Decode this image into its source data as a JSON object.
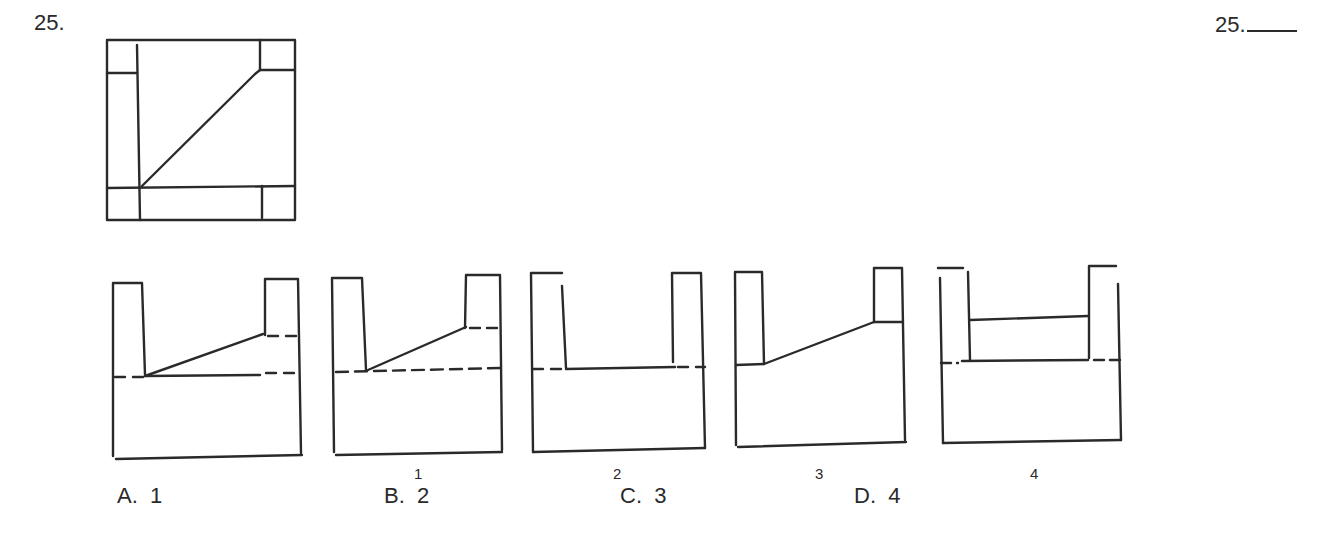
{
  "question": {
    "number_label": "25.",
    "answer_label": "25.",
    "answer_blank": ""
  },
  "top_view": {
    "description": "Top view: square with corner squares at top-left and top-right, left vertical band, bottom horizontal band, and a diagonal line from bottom-left inner corner to top-right inner corner"
  },
  "views": [
    {
      "id": "given",
      "caption": ""
    },
    {
      "id": "1",
      "caption": "1"
    },
    {
      "id": "2",
      "caption": "2"
    },
    {
      "id": "3",
      "caption": "3"
    },
    {
      "id": "4",
      "caption": "4"
    }
  ],
  "choices": [
    {
      "letter": "A.",
      "value": "1"
    },
    {
      "letter": "B.",
      "value": "2"
    },
    {
      "letter": "C.",
      "value": "3"
    },
    {
      "letter": "D.",
      "value": "4"
    }
  ],
  "colors": {
    "ink": "#2a2a2a",
    "background": "#ffffff"
  }
}
